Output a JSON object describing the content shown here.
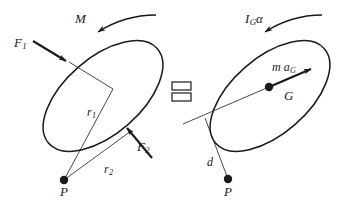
{
  "figure": {
    "type": "engineering-mechanics-diagram",
    "equality_symbol": "=",
    "stroke_color": "#1a1a1a",
    "background_color": "#ffffff"
  },
  "left_diagram": {
    "name": "free-body-diagram",
    "body_shape": "ellipse",
    "labels": {
      "moment": "M",
      "force_1": "F",
      "force_1_sub": "1",
      "force_2": "F",
      "force_2_sub": "2",
      "radius_1": "r",
      "radius_1_sub": "1",
      "radius_2": "r",
      "radius_2_sub": "2",
      "point_p": "P"
    }
  },
  "right_diagram": {
    "name": "kinetic-diagram",
    "body_shape": "ellipse",
    "labels": {
      "moment_of_inertia": "I",
      "moment_of_inertia_sub": "G",
      "angular_accel": "α",
      "mass_accel": "m a",
      "mass_accel_sub": "G",
      "center_of_mass": "G",
      "distance": "d",
      "point_p": "P"
    }
  }
}
